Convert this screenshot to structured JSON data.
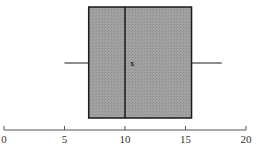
{
  "chart_data": {
    "type": "boxplot",
    "title": "",
    "xlabel": "",
    "ylabel": "",
    "orientation": "horizontal",
    "xlim": [
      0,
      20
    ],
    "ticks": [
      0,
      5,
      10,
      15,
      20
    ],
    "tick_labels": [
      "0",
      "5",
      "10",
      "15",
      "20"
    ],
    "grid": false,
    "legend": null,
    "box": {
      "min": 5,
      "q1": 7,
      "median": 10,
      "q3": 15.5,
      "max": 18,
      "mean": 10.6
    },
    "mean_marker": "x",
    "colors": {
      "box_fill": "#9a9a9a",
      "box_stroke": "#1a1a1a",
      "whisker": "#1a1a1a",
      "axis": "#555555"
    }
  }
}
